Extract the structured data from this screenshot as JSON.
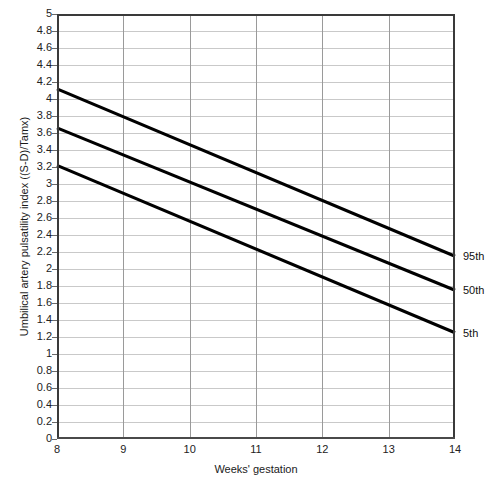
{
  "chart_data": {
    "type": "line",
    "title": "",
    "xlabel": "Weeks' gestation",
    "ylabel": "Umbilical artery pulsatility index ((S-D)/Tamx)",
    "xlim": [
      8,
      14
    ],
    "ylim": [
      0,
      5
    ],
    "grid": true,
    "legend_position": "right-of-plot-inline",
    "x_ticks": [
      "8",
      "9",
      "10",
      "11",
      "12",
      "13",
      "14"
    ],
    "y_ticks": [
      "0",
      "0.2",
      "0.4",
      "0.6",
      "0.8",
      "1",
      "1.2",
      "1.4",
      "1.6",
      "1.8",
      "2",
      "2.2",
      "2.4",
      "2.6",
      "2.8",
      "3",
      "3.2",
      "3.4",
      "3.6",
      "3.8",
      "4",
      "4.2",
      "4.4",
      "4.6",
      "4.8",
      "5"
    ],
    "x": [
      8,
      14
    ],
    "series": [
      {
        "name": "95th",
        "label": "95th",
        "values": [
          4.12,
          2.15
        ],
        "color": "#000000"
      },
      {
        "name": "50th",
        "label": "50th",
        "values": [
          3.66,
          1.75
        ],
        "color": "#000000"
      },
      {
        "name": "5th",
        "label": "5th",
        "values": [
          3.22,
          1.25
        ],
        "color": "#000000"
      }
    ]
  },
  "colors": {
    "line": "#000000",
    "gridline_horizontal": "#c9c9c9",
    "gridline_vertical": "#9a9a9a",
    "axis": "#3a3a3a",
    "background": "#ffffff"
  }
}
